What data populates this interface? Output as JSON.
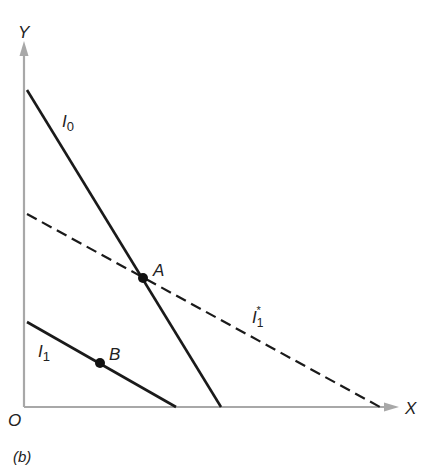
{
  "figure": {
    "panel_label": "(b)",
    "axes": {
      "x_label": "X",
      "y_label": "Y",
      "origin_label": "O"
    },
    "lines": [
      {
        "id": "I0",
        "label": "I",
        "subscript": "0",
        "style": "solid"
      },
      {
        "id": "I1",
        "label": "I",
        "subscript": "1",
        "style": "solid"
      },
      {
        "id": "I1star",
        "label": "I",
        "subscript": "1",
        "superscript": "*",
        "style": "dashed"
      }
    ],
    "points": [
      {
        "id": "A",
        "label": "A"
      },
      {
        "id": "B",
        "label": "B"
      }
    ],
    "colors": {
      "axis": "#a8a8a8",
      "line": "#1a1a1a"
    }
  }
}
